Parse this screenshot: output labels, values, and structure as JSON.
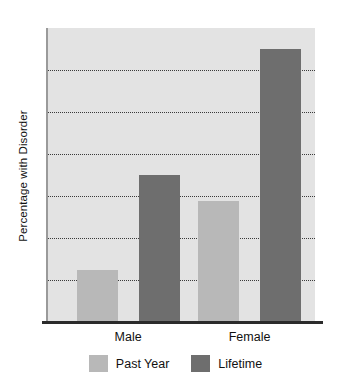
{
  "chart_data": {
    "type": "bar",
    "title": "",
    "xlabel": "",
    "ylabel": "Percentage with Disorder",
    "categories": [
      "Male",
      "Female"
    ],
    "series": [
      {
        "name": "Past Year",
        "color": "#b8b8b8",
        "values": [
          1.25,
          2.87
        ]
      },
      {
        "name": "Lifetime",
        "color": "#6e6e6e",
        "values": [
          3.5,
          6.5
        ]
      }
    ],
    "ylim": [
      0,
      7
    ],
    "yticks": [
      0,
      1,
      2,
      3,
      4,
      5,
      6,
      7
    ],
    "ytick_labels": [
      "0",
      "1",
      "2",
      "3",
      "4",
      "5",
      "6",
      "7"
    ],
    "gridlines": [
      1,
      2,
      3,
      4,
      5,
      6
    ],
    "grid": true,
    "grid_style": "dotted",
    "legend_position": "bottom",
    "plot_background": "#e3e3e3",
    "axis_color": "#2b2b2b"
  },
  "axis": {
    "y_title": "Percentage with Disorder"
  },
  "legend": {
    "items": [
      {
        "label": "Past Year",
        "color": "#b8b8b8"
      },
      {
        "label": "Lifetime",
        "color": "#6e6e6e"
      }
    ]
  }
}
